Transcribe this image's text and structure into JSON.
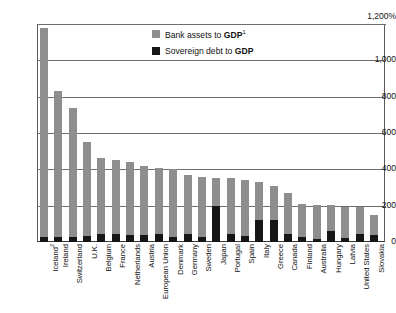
{
  "chart_data": {
    "type": "bar",
    "title": "",
    "xlabel": "",
    "ylabel": "",
    "ylim": [
      0,
      1200
    ],
    "yticks": [
      0,
      200,
      400,
      600,
      800,
      1000,
      1200
    ],
    "ytick_labels": [
      "0",
      "200",
      "400",
      "600",
      "800",
      "1,000",
      "1,200%"
    ],
    "grid": true,
    "stacked_overlay": true,
    "legend_position": "top-center",
    "categories": [
      "Iceland",
      "Ireland",
      "Switzerland",
      "U.K.",
      "Belgium",
      "France",
      "Netherlands",
      "Austria",
      "European Union",
      "Denmark",
      "Germany",
      "Sweden",
      "Japan",
      "Portugal",
      "Spain",
      "Italy",
      "Greece",
      "Canada",
      "Finland",
      "Australia",
      "Hungary",
      "Latvia",
      "United States",
      "Slovakia"
    ],
    "category_labels": [
      "Iceland²",
      "Ireland",
      "Switzerland",
      "U.K.",
      "Belgium",
      "France",
      "Netherlands",
      "Austria",
      "European Union",
      "Denmark",
      "Germany",
      "Sweden",
      "Japan",
      "Portugal",
      "Spain",
      "Italy",
      "Greece",
      "Canada",
      "Finland",
      "Australia",
      "Hungary",
      "Latvia",
      "United States",
      "Slovakia"
    ],
    "category_footnotes": {
      "Iceland": "2"
    },
    "series": [
      {
        "name": "Bank assets to GDP",
        "color": "#8e8e8e",
        "values": [
          1180,
          830,
          740,
          550,
          460,
          450,
          440,
          420,
          410,
          400,
          370,
          360,
          355,
          350,
          340,
          330,
          310,
          270,
          210,
          205,
          205,
          195,
          190,
          150
        ]
      },
      {
        "name": "Sovereign debt to GDP",
        "color": "#161616",
        "values": [
          30,
          30,
          25,
          35,
          45,
          45,
          40,
          40,
          45,
          25,
          45,
          25,
          200,
          45,
          35,
          120,
          120,
          45,
          30,
          15,
          60,
          20,
          45,
          40
        ]
      }
    ]
  },
  "legend": {
    "items": [
      {
        "label_prefix": "Bank assets to ",
        "label_bold": "GDP",
        "footnote": "1",
        "swatch": "gray",
        "swatch_color": "#8e8e8e"
      },
      {
        "label_prefix": "Sovereign debt to ",
        "label_bold": "GDP",
        "footnote": "",
        "swatch": "black",
        "swatch_color": "#161616"
      }
    ]
  },
  "axis": {
    "y_labels": [
      "1,200%",
      "1,000",
      "800",
      "600",
      "400",
      "200",
      "0"
    ]
  }
}
